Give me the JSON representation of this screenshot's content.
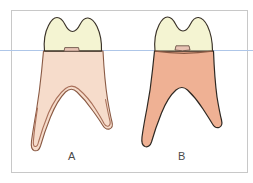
{
  "figure": {
    "background_color": "#ffffff",
    "frame": {
      "name": "diagram-frame",
      "stroke": "#c8c8c8",
      "fill": "#ffffff",
      "x": 11,
      "y": 10,
      "width": 236,
      "height": 162
    },
    "reference_line": {
      "name": "horizontal-reference-line",
      "color": "#aec6e8",
      "y": 50,
      "x_start": 0,
      "x_end": 253,
      "description": "light blue horizontal guide line crossing entire image at the cervical level"
    },
    "colors": {
      "crown_enamel": "#f4f4d2",
      "crown_outline": "#3a3228",
      "root_a_fill": "#f6dccb",
      "root_b_fill": "#efb194",
      "root_a_outline": "#8a5a44",
      "root_b_outline": "#2e2822",
      "pulp_outline": "#a9705a",
      "cervical_notch_fill": "#e8c3b4",
      "cervical_notch_outline": "#6b5247",
      "label_text": "#4a4a4a"
    },
    "specimens": [
      {
        "id": "A",
        "name": "tooth-a",
        "label": "A",
        "label_x": 72,
        "label_y": 156,
        "crown_color": "#f4f4d2",
        "root_color": "#f6dccb",
        "has_pulp_chamber_outline": true,
        "root_tone": "pale peach",
        "cusp_count": 2,
        "root_count": 2,
        "description": "Molar with pale peach root and visible internal pulp chamber outline tracing both root canals; roots widely splayed with rounded apices"
      },
      {
        "id": "B",
        "name": "tooth-b",
        "label": "B",
        "label_x": 182,
        "label_y": 156,
        "crown_color": "#f4f4d2",
        "root_color": "#efb194",
        "has_pulp_chamber_outline": false,
        "root_tone": "saturated salmon",
        "cusp_count": 2,
        "root_count": 2,
        "description": "Molar with solid salmon root, no internal pulp outline visible; roots narrower with shallower furcation"
      }
    ]
  }
}
